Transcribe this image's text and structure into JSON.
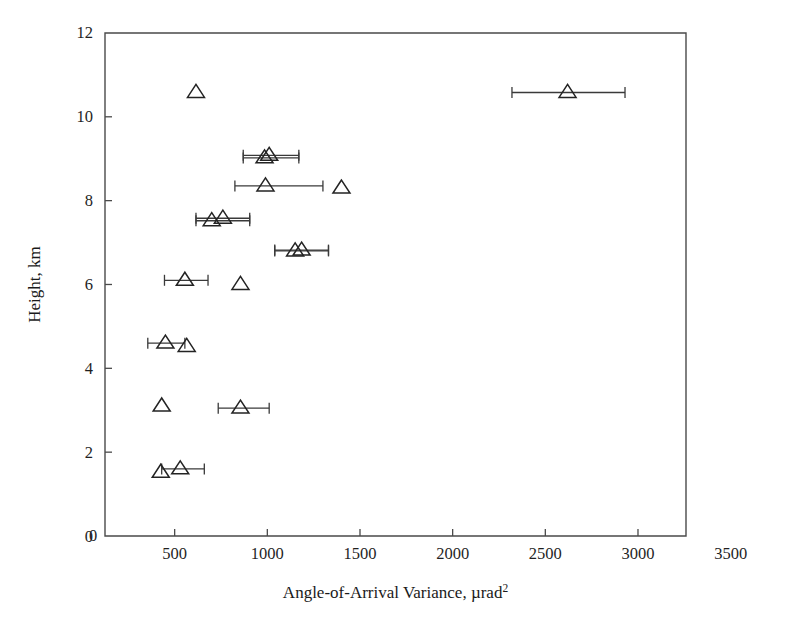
{
  "chart_data": {
    "type": "scatter",
    "title": "",
    "subtitle": "",
    "xlabel": "Angle-of-Arrival Variance, µrad",
    "xlabel_superscript": "2",
    "ylabel": "Height, km",
    "xlim": [
      0,
      3500
    ],
    "ylim": [
      0,
      12
    ],
    "xticks": [
      0,
      500,
      1000,
      1500,
      2000,
      2500,
      3000,
      3500
    ],
    "xticklabels": [
      "0",
      "500",
      "1000",
      "1500",
      "2000",
      "2500",
      "3000",
      "3500"
    ],
    "yticks": [
      0,
      2,
      4,
      6,
      8,
      10,
      12
    ],
    "yticklabels": [
      "0",
      "2",
      "4",
      "6",
      "8",
      "10",
      "12"
    ],
    "grid": false,
    "legend": null,
    "legend_position": "none",
    "marker": "triangle-up-open",
    "error_bars": "horizontal",
    "series": [
      {
        "name": "Angle-of-arrival variance profile",
        "points": [
          {
            "x": 425,
            "y": 1.52,
            "xerr_low": 425,
            "xerr_high": 425
          },
          {
            "x": 530,
            "y": 1.6,
            "xerr_low": 430,
            "xerr_high": 660
          },
          {
            "x": 430,
            "y": 3.1,
            "xerr_low": 430,
            "xerr_high": 430
          },
          {
            "x": 855,
            "y": 3.05,
            "xerr_low": 735,
            "xerr_high": 1010
          },
          {
            "x": 565,
            "y": 4.52,
            "xerr_low": 565,
            "xerr_high": 565
          },
          {
            "x": 450,
            "y": 4.6,
            "xerr_low": 355,
            "xerr_high": 555
          },
          {
            "x": 555,
            "y": 6.1,
            "xerr_low": 445,
            "xerr_high": 680
          },
          {
            "x": 855,
            "y": 6.0,
            "xerr_low": 855,
            "xerr_high": 855
          },
          {
            "x": 1150,
            "y": 6.8,
            "xerr_low": 1040,
            "xerr_high": 1330
          },
          {
            "x": 1185,
            "y": 6.82,
            "xerr_low": 1040,
            "xerr_high": 1330
          },
          {
            "x": 700,
            "y": 7.52,
            "xerr_low": 615,
            "xerr_high": 905
          },
          {
            "x": 760,
            "y": 7.58,
            "xerr_low": 615,
            "xerr_high": 905
          },
          {
            "x": 990,
            "y": 8.35,
            "xerr_low": 825,
            "xerr_high": 1300
          },
          {
            "x": 1400,
            "y": 8.3,
            "xerr_low": 1400,
            "xerr_high": 1400
          },
          {
            "x": 985,
            "y": 9.02,
            "xerr_low": 870,
            "xerr_high": 1170
          },
          {
            "x": 1010,
            "y": 9.08,
            "xerr_low": 870,
            "xerr_high": 1170
          },
          {
            "x": 615,
            "y": 10.58,
            "xerr_low": 615,
            "xerr_high": 615
          },
          {
            "x": 2620,
            "y": 10.58,
            "xerr_low": 2320,
            "xerr_high": 2930
          }
        ]
      }
    ]
  }
}
